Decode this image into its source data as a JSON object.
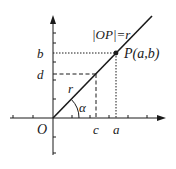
{
  "diagram": {
    "type": "coordinate-geometry",
    "colors": {
      "stroke": "#1a1a1a",
      "background": "#ffffff"
    },
    "labels": {
      "origin": "O",
      "x_point_c": "c",
      "x_point_a": "a",
      "y_point_b": "b",
      "y_point_d": "d",
      "point_p": "P(a,b)",
      "length_eq": "|OP|=r",
      "segment_r": "r",
      "angle": "α"
    },
    "elements": {
      "x_axis": {
        "has_arrow": true
      },
      "y_axis": {
        "has_arrow": true
      },
      "ray": {
        "from": "O",
        "through": "P"
      },
      "projection_b_dotted": {
        "style": "dotted"
      },
      "projection_a_dotted": {
        "style": "dotted"
      },
      "projection_d_dashed": {
        "style": "dashed"
      },
      "projection_c_dashed": {
        "style": "dashed"
      }
    }
  }
}
